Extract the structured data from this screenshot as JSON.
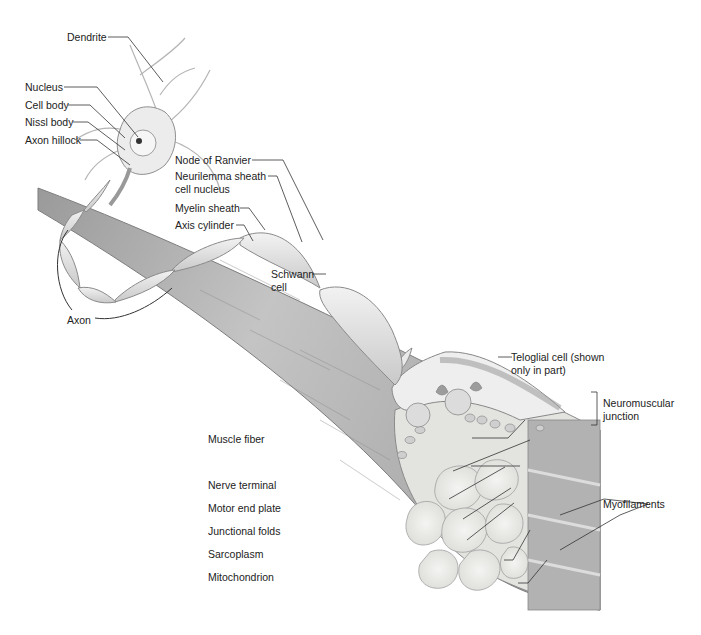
{
  "figure": {
    "colors": {
      "background": "#ffffff",
      "tissue_light": "#e6e6e6",
      "tissue_mid": "#b5b5b5",
      "tissue_dark": "#8a8a8a",
      "leader_line": "#333333"
    }
  },
  "labels": {
    "dendrite": "Dendrite",
    "nucleus": "Nucleus",
    "cell_body": "Cell body",
    "nissl_body": "Nissl body",
    "axon_hillock": "Axon hillock",
    "node_of_ranvier": "Node of Ranvier",
    "neurilemma_line1": "Neurilemma sheath",
    "neurilemma_line2": "cell nucleus",
    "myelin_sheath": "Myelin sheath",
    "axis_cylinder": "Axis cylinder",
    "schwann_line1": "Schwann",
    "schwann_line2": "cell",
    "axon": "Axon",
    "teloglial_line1": "Teloglial cell (shown",
    "teloglial_line2": "only in part)",
    "nmj_line1": "Neuromuscular",
    "nmj_line2": "junction",
    "muscle_fiber": "Muscle fiber",
    "nerve_terminal": "Nerve terminal",
    "motor_end_plate": "Motor end plate",
    "junctional_folds": "Junctional folds",
    "sarcoplasm": "Sarcoplasm",
    "mitochondrion": "Mitochondrion",
    "myofilaments": "Myofilaments"
  }
}
